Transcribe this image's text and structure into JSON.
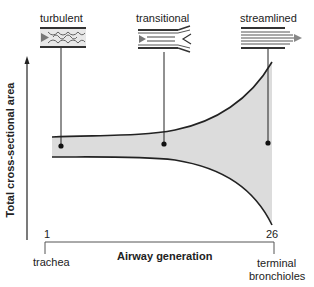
{
  "diagram": {
    "flow_types": [
      {
        "label": "turbulent",
        "x": 61
      },
      {
        "label": "transitional",
        "x": 164
      },
      {
        "label": "streamlined",
        "x": 268
      }
    ],
    "y_axis_label": "Total cross-sectional area",
    "x_axis_label": "Airway generation",
    "x_start_tick": "1",
    "x_end_tick": "26",
    "x_start_name": "trachea",
    "x_end_name_line1": "terminal",
    "x_end_name_line2": "bronchioles",
    "colors": {
      "fill": "#dcdcdc",
      "stroke": "#222222"
    }
  }
}
